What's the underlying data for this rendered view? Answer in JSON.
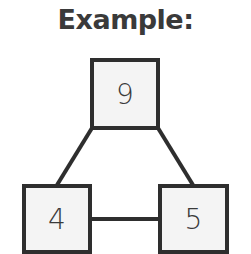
{
  "title": "Example:",
  "nodes": {
    "top": "9",
    "bottom_left": "4",
    "bottom_right": "5"
  },
  "edges": [
    {
      "from": "top",
      "to": "bottom_left"
    },
    {
      "from": "top",
      "to": "bottom_right"
    },
    {
      "from": "bottom_left",
      "to": "bottom_right"
    }
  ]
}
